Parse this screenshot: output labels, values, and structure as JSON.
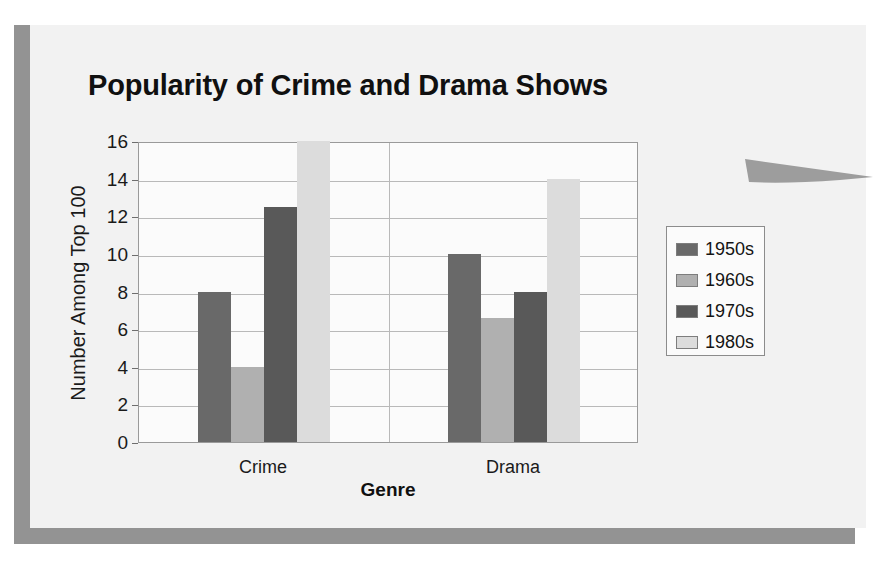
{
  "slide": {
    "background_color": "#f2f2f2",
    "frame_color": "#939393",
    "curl_color": "#9d9d9d"
  },
  "chart_data": {
    "type": "bar",
    "title": "Popularity of Crime and Drama Shows",
    "xlabel": "Genre",
    "ylabel": "Number Among Top 100",
    "categories": [
      "Crime",
      "Drama"
    ],
    "series": [
      {
        "name": "1950s",
        "color": "#696969",
        "values": [
          8,
          10
        ]
      },
      {
        "name": "1960s",
        "color": "#b0b0b0",
        "values": [
          4,
          6.6
        ]
      },
      {
        "name": "1970s",
        "color": "#595959",
        "values": [
          12.5,
          8
        ]
      },
      {
        "name": "1980s",
        "color": "#dcdcdc",
        "values": [
          16,
          14
        ]
      }
    ],
    "ylim": [
      0,
      16
    ],
    "ytick_values": [
      0,
      2,
      4,
      6,
      8,
      10,
      12,
      14,
      16
    ],
    "ytick_labels": [
      "0",
      "2",
      "4",
      "6",
      "8",
      "10",
      "12",
      "14",
      "16"
    ],
    "grid": true,
    "legend_position": "right",
    "legend_entries": [
      "1950s",
      "1960s",
      "1970s",
      "1980s"
    ]
  }
}
